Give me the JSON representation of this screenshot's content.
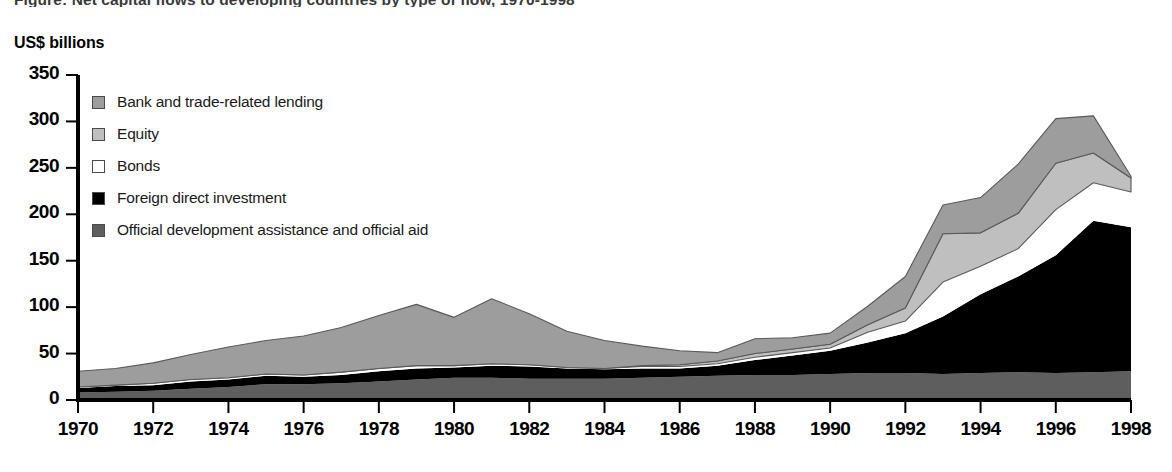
{
  "figure": {
    "cropped_title": "Figure:  Net capital flows to developing countries by type of flow, 1970-1998",
    "y_axis_title": "US$ billions"
  },
  "legend": {
    "items": [
      {
        "label": "Bank and trade-related lending",
        "swatch": "#9d9d9d",
        "key": "bank"
      },
      {
        "label": "Equity",
        "swatch": "#bfbfbf",
        "key": "equity"
      },
      {
        "label": "Bonds",
        "swatch": "#ffffff",
        "key": "bonds"
      },
      {
        "label": "Foreign direct investment",
        "swatch": "#000000",
        "key": "fdi"
      },
      {
        "label": "Official development assistance and official aid",
        "swatch": "#5e5e5e",
        "key": "oda"
      }
    ]
  },
  "chart_data": {
    "type": "area",
    "stacked": true,
    "title": "Net capital flows to developing countries by type of flow, 1970-1998",
    "xlabel": "",
    "ylabel": "US$ billions",
    "ylim": [
      0,
      350
    ],
    "yticks": [
      0,
      50,
      100,
      150,
      200,
      250,
      300,
      350
    ],
    "xlim": [
      1970,
      1998
    ],
    "xticks": [
      1970,
      1972,
      1974,
      1976,
      1978,
      1980,
      1982,
      1984,
      1986,
      1988,
      1990,
      1992,
      1994,
      1996,
      1998
    ],
    "grid": false,
    "legend_position": "inside-upper-left",
    "x": [
      1970,
      1971,
      1972,
      1973,
      1974,
      1975,
      1976,
      1977,
      1978,
      1979,
      1980,
      1981,
      1982,
      1983,
      1984,
      1985,
      1986,
      1987,
      1988,
      1989,
      1990,
      1991,
      1992,
      1993,
      1994,
      1995,
      1996,
      1997,
      1998
    ],
    "series": [
      {
        "name": "Official development assistance and official aid",
        "color": "#5e5e5e",
        "values": [
          8,
          9,
          10,
          12,
          14,
          17,
          17,
          18,
          20,
          22,
          24,
          24,
          23,
          23,
          23,
          24,
          25,
          26,
          27,
          27,
          28,
          29,
          29,
          28,
          29,
          30,
          29,
          30,
          31
        ]
      },
      {
        "name": "Foreign direct investment",
        "color": "#000000",
        "values": [
          5,
          6,
          6,
          8,
          8,
          9,
          8,
          9,
          11,
          12,
          11,
          13,
          13,
          11,
          10,
          10,
          9,
          11,
          16,
          21,
          25,
          33,
          43,
          62,
          85,
          103,
          127,
          163,
          155
        ]
      },
      {
        "name": "Bonds",
        "color": "#ffffff",
        "values": [
          1,
          1,
          2,
          2,
          2,
          2,
          2,
          3,
          3,
          3,
          2,
          2,
          2,
          1,
          1,
          2,
          2,
          2,
          3,
          3,
          3,
          11,
          13,
          37,
          30,
          30,
          49,
          41,
          38
        ]
      },
      {
        "name": "Equity",
        "color": "#bfbfbf",
        "values": [
          0,
          0,
          0,
          0,
          0,
          0,
          0,
          0,
          0,
          0,
          0,
          0,
          0,
          0,
          0,
          1,
          2,
          3,
          4,
          4,
          4,
          8,
          14,
          52,
          36,
          38,
          50,
          32,
          15
        ]
      },
      {
        "name": "Bank and trade-related lending",
        "color": "#9d9d9d",
        "values": [
          17,
          18,
          22,
          27,
          33,
          36,
          42,
          48,
          57,
          66,
          52,
          70,
          55,
          39,
          30,
          21,
          15,
          9,
          16,
          12,
          12,
          20,
          34,
          31,
          38,
          53,
          48,
          40,
          2
        ]
      }
    ],
    "totals": [
      31,
      34,
      40,
      49,
      57,
      64,
      69,
      78,
      91,
      103,
      89,
      109,
      93,
      74,
      64,
      58,
      53,
      51,
      66,
      67,
      72,
      101,
      133,
      210,
      218,
      254,
      303,
      306,
      241
    ]
  }
}
